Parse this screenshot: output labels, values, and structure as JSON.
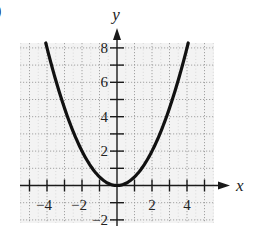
{
  "figure_label": ")",
  "chart_data": {
    "type": "line",
    "title": "",
    "function": "y = x^2 / 2",
    "xlabel": "x",
    "ylabel": "y",
    "xlim": [
      -5.5,
      5.5
    ],
    "ylim": [
      -2.2,
      8.3
    ],
    "grid": true,
    "grid_style": "dotted",
    "x_ticks": [
      -5,
      -4,
      -3,
      -2,
      -1,
      1,
      2,
      3,
      4,
      5
    ],
    "x_tick_labels": [
      {
        "value": -4,
        "label": "−4"
      },
      {
        "value": -2,
        "label": "−2"
      },
      {
        "value": 2,
        "label": "2"
      },
      {
        "value": 4,
        "label": "4"
      }
    ],
    "y_ticks": [
      -2,
      -1,
      1,
      2,
      3,
      4,
      5,
      6,
      7,
      8
    ],
    "y_tick_labels": [
      {
        "value": 8,
        "label": "8"
      },
      {
        "value": 6,
        "label": "6"
      },
      {
        "value": 4,
        "label": "4"
      },
      {
        "value": 2,
        "label": "2"
      },
      {
        "value": -2,
        "label": "−2"
      }
    ],
    "series": [
      {
        "name": "parabola",
        "x": [
          -4.1,
          -4,
          -3,
          -2,
          -1,
          0,
          1,
          2,
          3,
          4,
          4.1
        ],
        "y": [
          8.4,
          8,
          4.5,
          2,
          0.5,
          0,
          0.5,
          2,
          4.5,
          8,
          8.4
        ],
        "color": "#111111"
      }
    ]
  },
  "layout": {
    "origin_px": [
      117,
      185.5
    ],
    "unit_x_px": 17.5,
    "unit_y_px": 17.2,
    "grid_box_px": [
      20,
      43,
      214,
      223
    ],
    "grid_color": "#9a9a9a",
    "axis_color": "#1a1a1a",
    "curve_color": "#111111"
  }
}
